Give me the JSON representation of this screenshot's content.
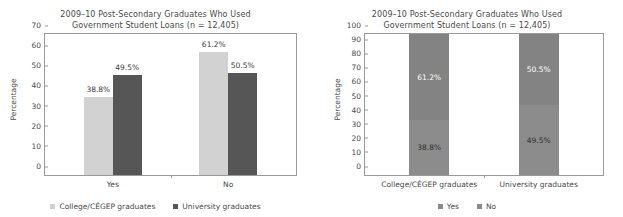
{
  "figure": {
    "panels": [
      {
        "id": "grouped-bar-panel",
        "title_line1": "2009–10 Post-Secondary Graduates Who Used",
        "title_line2": "Government Student Loans (n = 12,405)"
      },
      {
        "id": "stacked-bar-panel",
        "title_line1": "2009–10 Post-Secondary Graduates Who Used",
        "title_line2": "Government Student Loans (n = 12,405)"
      }
    ]
  },
  "colors": {
    "college_light": "#d2d2d2",
    "university_dark": "#565656",
    "stack_yes": "#8c8c8c",
    "stack_no": "#838383",
    "axis": "#9a9a9a",
    "text": "#4a4a4a"
  },
  "chart_data": [
    {
      "type": "bar",
      "id": "left-grouped-bar",
      "title": "2009–10 Post-Secondary Graduates Who Used Government Student Loans (n = 12,405)",
      "xlabel": "",
      "ylabel": "Percentage",
      "ylim": [
        0,
        70
      ],
      "yticks": [
        0,
        10,
        20,
        30,
        40,
        50,
        60,
        70
      ],
      "grid": false,
      "legend_position": "bottom",
      "categories": [
        "Yes",
        "No"
      ],
      "series": [
        {
          "name": "College/CÉGEP graduates",
          "color": "#d2d2d2",
          "values": [
            38.8,
            61.2
          ],
          "labels": [
            "38.8%",
            "61.2%"
          ]
        },
        {
          "name": "University graduates",
          "color": "#565656",
          "values": [
            49.5,
            50.5
          ],
          "labels": [
            "49.5%",
            "50.5%"
          ]
        }
      ]
    },
    {
      "type": "bar",
      "id": "right-stacked-bar",
      "stacked": true,
      "title": "2009–10 Post-Secondary Graduates Who Used Government Student Loans (n = 12,405)",
      "xlabel": "",
      "ylabel": "Percentage",
      "ylim": [
        0,
        100
      ],
      "yticks": [
        0,
        10,
        20,
        30,
        40,
        50,
        60,
        70,
        80,
        90,
        100
      ],
      "grid": false,
      "legend_position": "bottom",
      "categories": [
        "College/CÉGEP graduates",
        "University graduates"
      ],
      "series": [
        {
          "name": "Yes",
          "color": "#8c8c8c",
          "values": [
            38.8,
            49.5
          ],
          "labels": [
            "38.8%",
            "49.5%"
          ]
        },
        {
          "name": "No",
          "color": "#838383",
          "values": [
            61.2,
            50.5
          ],
          "labels": [
            "61.2%",
            "50.5%"
          ]
        }
      ]
    }
  ]
}
